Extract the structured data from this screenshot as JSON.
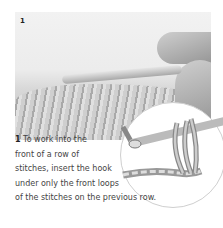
{
  "figure": {
    "step_number": "1",
    "photo_description": "Hands holding crochet hook inserted into front loops of a row of stitches",
    "diagram_description": "Illustration of hook inserted under front loops of stitches"
  },
  "caption": {
    "number": "1",
    "lines": [
      " To work into the",
      "front of a row of",
      "stitches, insert the hook",
      "under only the front loops",
      "of the stitches on the previous row."
    ]
  }
}
